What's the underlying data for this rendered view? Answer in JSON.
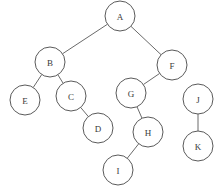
{
  "diagram": {
    "type": "tree-forest",
    "node_radius": 15,
    "colors": {
      "background": "#ffffff",
      "node_fill": "#ffffff",
      "node_stroke": "#5a5a5a",
      "edge": "#6a6a6a",
      "label": "#3a3a3a"
    },
    "nodes": [
      {
        "id": "A",
        "label": "A",
        "x": 120,
        "y": 16
      },
      {
        "id": "B",
        "label": "B",
        "x": 50,
        "y": 62
      },
      {
        "id": "F",
        "label": "F",
        "x": 172,
        "y": 65
      },
      {
        "id": "E",
        "label": "E",
        "x": 25,
        "y": 100
      },
      {
        "id": "C",
        "label": "C",
        "x": 71,
        "y": 96
      },
      {
        "id": "D",
        "label": "D",
        "x": 98,
        "y": 128
      },
      {
        "id": "G",
        "label": "G",
        "x": 131,
        "y": 93
      },
      {
        "id": "H",
        "label": "H",
        "x": 148,
        "y": 132
      },
      {
        "id": "I",
        "label": "I",
        "x": 118,
        "y": 170
      },
      {
        "id": "J",
        "label": "J",
        "x": 198,
        "y": 99
      },
      {
        "id": "K",
        "label": "K",
        "x": 198,
        "y": 146
      }
    ],
    "edges": [
      [
        "A",
        "B"
      ],
      [
        "A",
        "F"
      ],
      [
        "B",
        "E"
      ],
      [
        "B",
        "C"
      ],
      [
        "C",
        "D"
      ],
      [
        "F",
        "G"
      ],
      [
        "G",
        "H"
      ],
      [
        "H",
        "I"
      ],
      [
        "J",
        "K"
      ]
    ]
  }
}
